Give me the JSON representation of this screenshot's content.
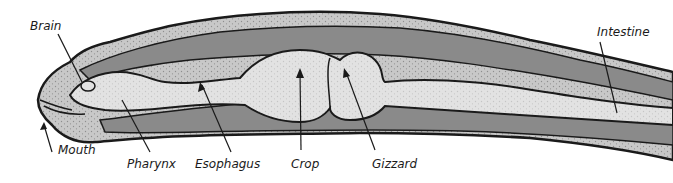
{
  "diagram": {
    "colors": {
      "background": "#ffffff",
      "outline": "#1a1a1a",
      "outer_body": "#c8c8c8",
      "muscle_band": "#8a8a8a",
      "organ_light": "#e2e2e2",
      "inner_layer": "#b4b4b4"
    },
    "labels": [
      {
        "id": "brain",
        "text": "Brain",
        "x": 30,
        "y": 19
      },
      {
        "id": "mouth",
        "text": "Mouth",
        "x": 58,
        "y": 143
      },
      {
        "id": "pharynx",
        "text": "Pharynx",
        "x": 127,
        "y": 157
      },
      {
        "id": "esophagus",
        "text": "Esophagus",
        "x": 195,
        "y": 157
      },
      {
        "id": "crop",
        "text": "Crop",
        "x": 291,
        "y": 157
      },
      {
        "id": "gizzard",
        "text": "Gizzard",
        "x": 372,
        "y": 157
      },
      {
        "id": "intestine",
        "text": "Intestine",
        "x": 597,
        "y": 25
      }
    ]
  }
}
